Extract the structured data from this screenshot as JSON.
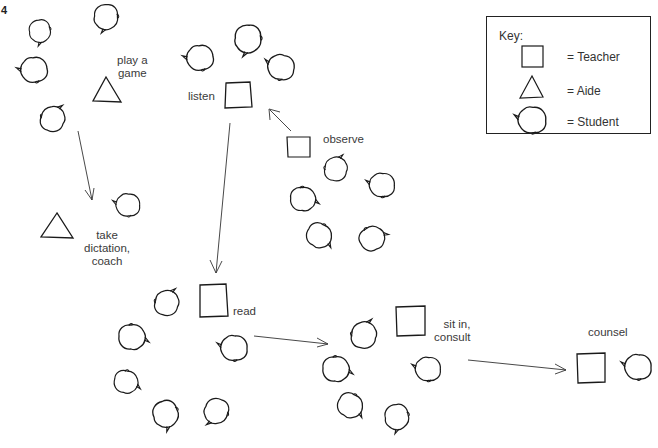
{
  "page": {
    "number": "4",
    "margin_text": "Materials"
  },
  "key": {
    "title": "Key:",
    "entries": [
      {
        "symbol": "square",
        "label": "= Teacher"
      },
      {
        "symbol": "triangle",
        "label": "= Aide"
      },
      {
        "symbol": "head",
        "label": "= Student"
      }
    ]
  },
  "groups": {
    "play_game": {
      "label_line1": "play a",
      "label_line2": "game"
    },
    "listen": {
      "label": "listen"
    },
    "observe": {
      "label": "observe"
    },
    "dictation": {
      "label_line1": "take",
      "label_line2": "dictation,",
      "label_line3": "coach"
    },
    "read": {
      "label": "read"
    },
    "sit_in": {
      "label_line1": "sit in,",
      "label_line2": "consult"
    },
    "counsel": {
      "label": "counsel"
    }
  },
  "colors": {
    "stroke": "#1a1a1a",
    "text": "#3a3a3a",
    "background": "#ffffff"
  }
}
